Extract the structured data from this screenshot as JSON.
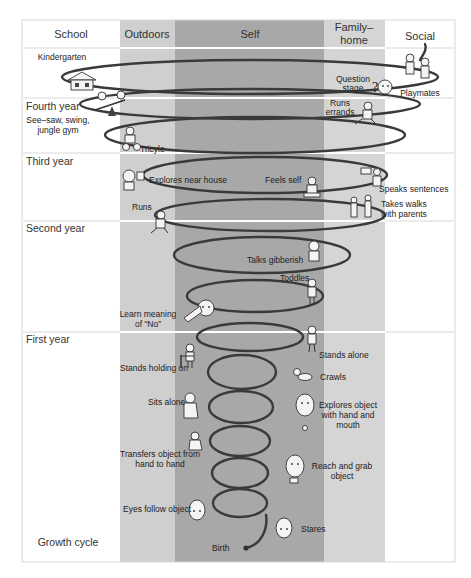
{
  "diagram": {
    "title": "Growth cycle",
    "columns": [
      {
        "id": "school",
        "label": "School",
        "x": 22,
        "w": 98,
        "color": "#ffffff"
      },
      {
        "id": "outdoors",
        "label": "Outdoors",
        "x": 120,
        "w": 55,
        "color": "#cfcfcf"
      },
      {
        "id": "self",
        "label": "Self",
        "x": 175,
        "w": 149,
        "color": "#a8a8a8"
      },
      {
        "id": "family",
        "label_line1": "Family–",
        "label_line2": "home",
        "x": 324,
        "w": 61,
        "color": "#d5d5d5"
      },
      {
        "id": "social",
        "label": "Social",
        "x": 385,
        "w": 70,
        "color": "#ffffff"
      }
    ],
    "rows": [
      {
        "label": "Fourth year",
        "sublabel_line1": "See–saw, swing,",
        "sublabel_line2": "jungle gym",
        "y": 98
      },
      {
        "label": "Third year",
        "y": 153
      },
      {
        "label": "Second year",
        "y": 221
      },
      {
        "label": "First year",
        "y": 332
      }
    ],
    "milestones": {
      "kindergarten": "Kindergarten",
      "question_stage_1": "Question",
      "question_stage_2": "stage",
      "playmates": "Playmates",
      "runs_errands_1": "Runs",
      "runs_errands_2": "errands",
      "tricyle": "Tricyle",
      "explores_near_house": "Explores near house",
      "feels_self": "Feels self",
      "speaks_sentences": "Speaks sentences",
      "takes_walks_1": "Takes walks",
      "takes_walks_2": "with parents",
      "runs": "Runs",
      "talks_gibberish": "Talks gibberish",
      "toddles": "Toddles",
      "learn_no_1": "Learn meaning",
      "learn_no_2": "of “No”",
      "stands_alone": "Stands alone",
      "stands_holding_on": "Stands holding on",
      "crawls": "Crawls",
      "sits_alone": "Sits alone",
      "explores_object_1": "Explores object",
      "explores_object_2": "with hand and",
      "explores_object_3": "mouth",
      "transfers_1": "Transfers object from",
      "transfers_2": "hand to hand",
      "reach_grab_1": "Reach and grab",
      "reach_grab_2": "object",
      "eyes_follow": "Eyes follow object",
      "stares": "Stares",
      "birth": "Birth"
    },
    "question_mark": "?"
  }
}
